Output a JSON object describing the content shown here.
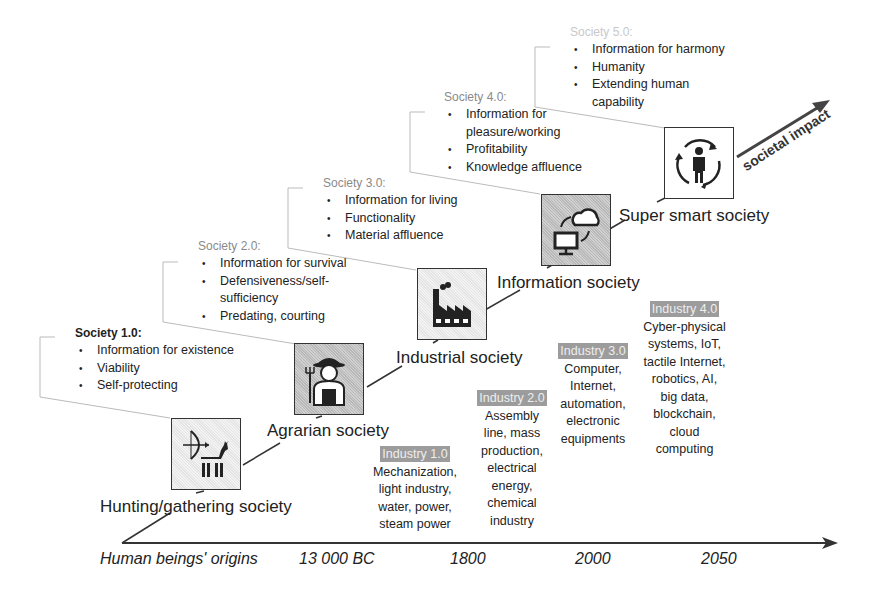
{
  "societies": [
    {
      "title": "Society 1.0:",
      "bullets": [
        "Information for existence",
        "Viability",
        "Self-protecting"
      ],
      "name": "Hunting/gathering society",
      "icon": "hunter-bow-deer-icon"
    },
    {
      "title": "Society 2.0:",
      "bullets": [
        "Information for survival",
        "Defensiveness/self-sufficiency",
        "Predating, courting"
      ],
      "name": "Agrarian society",
      "icon": "farmer-pitchfork-icon"
    },
    {
      "title": "Society 3.0:",
      "bullets": [
        "Information for living",
        "Functionality",
        "Material affluence"
      ],
      "name": "Industrial society",
      "icon": "factory-icon"
    },
    {
      "title": "Society 4.0:",
      "bullets": [
        "Information for pleasure/working",
        "Profitability",
        "Knowledge affluence"
      ],
      "name": "Information society",
      "icon": "computer-cloud-icon"
    },
    {
      "title": "Society 5.0:",
      "bullets": [
        "Information for harmony",
        "Humanity",
        "Extending human capability"
      ],
      "name": "Super smart society",
      "icon": "human-cycle-icon"
    }
  ],
  "industries": [
    {
      "badge": "Industry 1.0",
      "text": [
        "Mechanization,",
        "light industry,",
        "water, power,",
        "steam power"
      ]
    },
    {
      "badge": "Industry 2.0",
      "text": [
        "Assembly",
        "line, mass",
        "production,",
        "electrical",
        "energy,",
        "chemical",
        "industry"
      ]
    },
    {
      "badge": "Industry 3.0",
      "text": [
        "Computer,",
        "Internet,",
        "automation,",
        "electronic",
        "equipments"
      ]
    },
    {
      "badge": "Industry 4.0",
      "text": [
        "Cyber-physical",
        "systems, IoT,",
        "tactile Internet,",
        "robotics, AI,",
        "big data,",
        "blockchain,",
        "cloud",
        "computing"
      ]
    }
  ],
  "timeline": [
    "Human beings' origins",
    "13 000 BC",
    "1800",
    "2000",
    "2050"
  ],
  "impact_label": "societal impact"
}
